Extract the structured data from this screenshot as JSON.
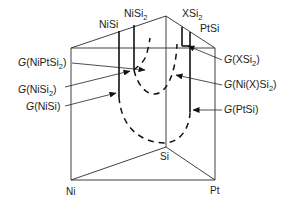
{
  "diagram": {
    "type": "ternary-prism-free-energy",
    "vertices": {
      "ni": "Ni",
      "pt": "Pt",
      "si": "Si"
    },
    "phase_labels": {
      "nisi": "NiSi",
      "nisi2_base": "NiSi",
      "nisi2_sub": "2",
      "xsi2_base": "XSi",
      "xsi2_sub": "2",
      "ptsi": "PtSi"
    },
    "curve_labels": [
      {
        "id": "g-niptsi2",
        "g": "G",
        "open": "(NiPtSi",
        "sub": "2",
        "close": ")"
      },
      {
        "id": "g-nisi2",
        "g": "G",
        "open": "(NiSi",
        "sub": "2",
        "close": ")"
      },
      {
        "id": "g-nisi",
        "g": "G",
        "open": "(NiSi)",
        "sub": "",
        "close": ""
      },
      {
        "id": "g-xsi2",
        "g": "G",
        "open": "(XSi",
        "sub": "2",
        "close": ")"
      },
      {
        "id": "g-nixsi2",
        "g": "G",
        "open": "(Ni(X)Si",
        "sub": "2",
        "close": ")"
      },
      {
        "id": "g-ptsi",
        "g": "G",
        "open": "(PtSi)",
        "sub": "",
        "close": ""
      }
    ],
    "colors": {
      "line": "#222222",
      "background": "#ffffff"
    }
  }
}
